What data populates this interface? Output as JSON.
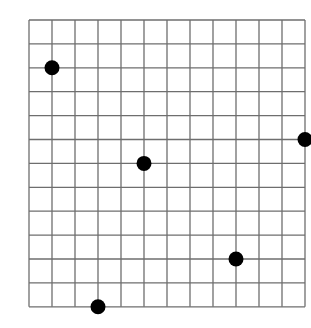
{
  "grid": {
    "columns": 12,
    "rows": 12,
    "origin_px": [
      29,
      20
    ],
    "cell_w": 23,
    "cell_h": 23.9,
    "line_color": "#6e6e6e",
    "background": "#ffffff"
  },
  "points": [
    {
      "col": 1,
      "row": 2
    },
    {
      "col": 5,
      "row": 6
    },
    {
      "col": 12,
      "row": 5
    },
    {
      "col": 9,
      "row": 10
    },
    {
      "col": 3,
      "row": 12
    }
  ],
  "point_style": {
    "radius": 7.5,
    "color": "#000000"
  }
}
